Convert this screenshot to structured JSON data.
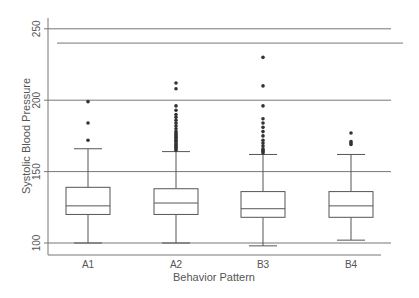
{
  "chart_data": {
    "type": "box",
    "title": "",
    "xlabel": "Behavior Pattern",
    "ylabel": "Systolic Blood Pressure",
    "ylim": [
      92,
      255
    ],
    "yticks": [
      100,
      150,
      200,
      250
    ],
    "grid": true,
    "extra_reference_line": 240,
    "categories": [
      "A1",
      "A2",
      "B3",
      "B4"
    ],
    "boxes": [
      {
        "category": "A1",
        "whisker_low": 100,
        "q1": 120,
        "median": 126,
        "q3": 139,
        "whisker_high": 166,
        "outliers": [
          172,
          184,
          199
        ]
      },
      {
        "category": "A2",
        "whisker_low": 100,
        "q1": 120,
        "median": 128,
        "q3": 138,
        "whisker_high": 164,
        "outliers": [
          165,
          166,
          167,
          168,
          169,
          170,
          171,
          172,
          173,
          174,
          175,
          176,
          177,
          178,
          180,
          182,
          184,
          186,
          188,
          190,
          193,
          196,
          208,
          212
        ]
      },
      {
        "category": "B3",
        "whisker_low": 98,
        "q1": 118,
        "median": 124,
        "q3": 136,
        "whisker_high": 162,
        "outliers": [
          163,
          164,
          165,
          166,
          168,
          170,
          172,
          175,
          178,
          181,
          184,
          187,
          196,
          210,
          230
        ]
      },
      {
        "category": "B4",
        "whisker_low": 102,
        "q1": 118,
        "median": 126,
        "q3": 136,
        "whisker_high": 162,
        "outliers": [
          169,
          170,
          171,
          177
        ]
      }
    ],
    "colors": {
      "box_stroke": "#555555",
      "grid": "#777777",
      "outlier": "#333333",
      "text": "#555555"
    }
  }
}
